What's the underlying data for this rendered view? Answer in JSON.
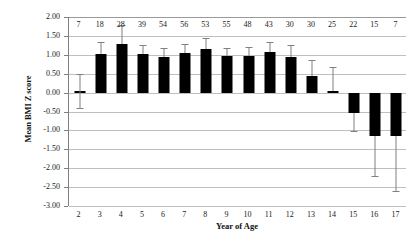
{
  "chart_data": {
    "type": "bar",
    "title": "",
    "xlabel": "Year of Age",
    "ylabel": "Mean BMI Z score",
    "categories": [
      "2",
      "3",
      "4",
      "5",
      "6",
      "7",
      "8",
      "9",
      "10",
      "11",
      "12",
      "13",
      "14",
      "15",
      "16",
      "17"
    ],
    "values": [
      0.03,
      1.02,
      1.28,
      1.03,
      0.93,
      1.04,
      1.15,
      0.97,
      0.97,
      1.07,
      0.95,
      0.44,
      0.03,
      -0.55,
      -1.15,
      -1.15
    ],
    "error_upper": [
      0.46,
      0.33,
      0.5,
      0.24,
      0.25,
      0.25,
      0.29,
      0.22,
      0.24,
      0.26,
      0.32,
      0.43,
      0.65,
      0.0,
      0.0,
      0.0
    ],
    "error_lower": [
      0.43,
      0.0,
      0.0,
      0.0,
      0.0,
      0.0,
      0.0,
      0.0,
      0.0,
      0.0,
      0.0,
      0.0,
      0.0,
      0.47,
      1.05,
      1.45
    ],
    "counts": [
      "7",
      "18",
      "28",
      "39",
      "54",
      "56",
      "53",
      "55",
      "48",
      "43",
      "30",
      "30",
      "25",
      "22",
      "15",
      "7"
    ],
    "ylim": [
      -3.0,
      2.0
    ],
    "ytick_labels": [
      "2.00",
      "1.50",
      "1.00",
      "0.50",
      "0.00",
      "-0.50",
      "-1.00",
      "-1.50",
      "-2.00",
      "-2.50",
      "-3.00"
    ],
    "ytick_values": [
      2.0,
      1.5,
      1.0,
      0.5,
      0.0,
      -0.5,
      -1.0,
      -1.5,
      -2.0,
      -2.5,
      -3.0
    ],
    "grid": true,
    "legend": "none",
    "bar_color": "#000000",
    "error_color": "#808080",
    "grid_color": "#bfbfbf"
  }
}
